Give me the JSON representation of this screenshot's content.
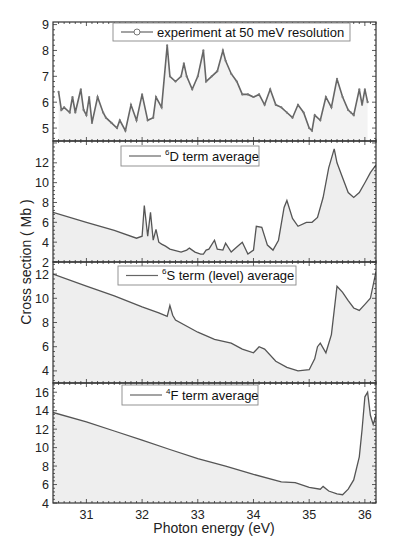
{
  "chart_data": {
    "type": "area",
    "layout": "4 vertically stacked panels sharing x-axis",
    "xlabel": "Photon energy (eV)",
    "ylabel": "Cross section  ( Mb )",
    "xlim": [
      30.4,
      36.2
    ],
    "xticks": [
      31,
      32,
      33,
      34,
      35,
      36
    ],
    "grid": false,
    "panels": [
      {
        "id": "experiment",
        "legend": "experiment at 50 meV resolution",
        "legend_marker": "circle-line",
        "ylim": [
          4.5,
          9.1
        ],
        "yticks": [
          5,
          6,
          7,
          8,
          9
        ],
        "x": [
          30.5,
          30.55,
          30.6,
          30.7,
          30.75,
          30.8,
          30.9,
          30.95,
          31.0,
          31.05,
          31.1,
          31.2,
          31.3,
          31.35,
          31.45,
          31.55,
          31.6,
          31.7,
          31.8,
          31.9,
          32.0,
          32.1,
          32.2,
          32.25,
          32.35,
          32.45,
          32.5,
          32.6,
          32.7,
          32.75,
          32.8,
          32.9,
          33.0,
          33.1,
          33.15,
          33.25,
          33.35,
          33.45,
          33.5,
          33.6,
          33.7,
          33.8,
          33.9,
          34.0,
          34.1,
          34.2,
          34.3,
          34.4,
          34.5,
          34.6,
          34.7,
          34.8,
          34.9,
          35.0,
          35.05,
          35.1,
          35.2,
          35.3,
          35.4,
          35.5,
          35.6,
          35.7,
          35.75,
          35.8,
          35.9,
          35.95,
          36.0,
          36.05
        ],
        "y": [
          6.4,
          5.7,
          5.8,
          5.6,
          6.2,
          5.6,
          6.5,
          5.7,
          5.5,
          6.2,
          5.2,
          6.2,
          5.6,
          5.4,
          5.2,
          5.0,
          5.3,
          4.9,
          5.9,
          5.3,
          6.3,
          5.3,
          5.4,
          6.2,
          5.8,
          8.2,
          7.0,
          6.8,
          7.0,
          7.5,
          7.0,
          6.5,
          7.0,
          8.0,
          6.8,
          7.0,
          7.2,
          8.0,
          7.6,
          7.1,
          6.8,
          6.3,
          6.3,
          6.2,
          6.3,
          5.9,
          6.5,
          5.9,
          5.8,
          5.6,
          5.4,
          5.9,
          5.6,
          5.0,
          4.9,
          5.5,
          5.3,
          6.2,
          5.8,
          6.9,
          6.2,
          5.7,
          5.6,
          5.5,
          6.5,
          5.9,
          6.5,
          6.0
        ]
      },
      {
        "id": "6D",
        "legend_sup": "6",
        "legend": "D term average",
        "ylim": [
          2,
          14.2
        ],
        "yticks": [
          2,
          4,
          6,
          8,
          10,
          12
        ],
        "x": [
          30.4,
          31.0,
          31.5,
          31.9,
          32.0,
          32.04,
          32.1,
          32.15,
          32.2,
          32.25,
          32.3,
          32.35,
          32.42,
          32.5,
          32.7,
          32.8,
          32.85,
          32.95,
          33.05,
          33.1,
          33.15,
          33.2,
          33.3,
          33.35,
          33.45,
          33.5,
          33.6,
          33.7,
          33.8,
          33.9,
          34.0,
          34.05,
          34.15,
          34.25,
          34.35,
          34.45,
          34.55,
          34.6,
          34.7,
          34.8,
          34.95,
          35.05,
          35.15,
          35.25,
          35.35,
          35.45,
          35.5,
          35.6,
          35.7,
          35.8,
          35.9,
          36.0,
          36.1,
          36.2
        ],
        "y": [
          7.0,
          6.0,
          5.2,
          4.4,
          4.6,
          7.7,
          4.6,
          7.0,
          4.2,
          5.3,
          4.0,
          3.8,
          3.6,
          3.3,
          3.0,
          3.2,
          3.4,
          3.0,
          2.8,
          2.8,
          3.2,
          3.3,
          4.2,
          3.3,
          3.2,
          3.9,
          3.0,
          3.5,
          4.0,
          2.8,
          3.2,
          5.6,
          5.5,
          3.7,
          3.2,
          4.2,
          7.5,
          8.2,
          6.4,
          5.6,
          6.0,
          6.0,
          6.5,
          8.5,
          11.5,
          13.4,
          12.0,
          10.5,
          9.0,
          8.5,
          9.0,
          10.0,
          11.0,
          11.8
        ]
      },
      {
        "id": "6S",
        "legend_sup": "6",
        "legend": "S term (level) average",
        "ylim": [
          3,
          13
        ],
        "yticks": [
          4,
          6,
          8,
          10,
          12
        ],
        "x": [
          30.4,
          31.0,
          31.5,
          32.0,
          32.3,
          32.45,
          32.5,
          32.55,
          32.6,
          33.0,
          33.3,
          33.6,
          33.8,
          34.0,
          34.1,
          34.2,
          34.4,
          34.6,
          34.8,
          35.0,
          35.1,
          35.15,
          35.2,
          35.3,
          35.4,
          35.5,
          35.6,
          35.7,
          35.8,
          35.9,
          36.0,
          36.1,
          36.2
        ],
        "y": [
          12.0,
          11.0,
          10.2,
          9.3,
          8.8,
          8.5,
          9.4,
          8.6,
          8.2,
          7.2,
          6.6,
          6.3,
          5.8,
          5.5,
          6.0,
          5.8,
          4.8,
          4.3,
          4.0,
          4.1,
          5.0,
          6.0,
          6.3,
          5.5,
          7.0,
          11.0,
          10.5,
          9.8,
          9.2,
          9.0,
          9.5,
          10.0,
          12.2
        ]
      },
      {
        "id": "4F",
        "legend_sup": "4",
        "legend": "F term average",
        "ylim": [
          4,
          17
        ],
        "yticks": [
          4,
          6,
          8,
          10,
          12,
          14,
          16
        ],
        "x": [
          30.4,
          31.0,
          31.5,
          32.0,
          32.5,
          33.0,
          33.5,
          34.0,
          34.5,
          34.75,
          35.0,
          35.2,
          35.25,
          35.35,
          35.5,
          35.6,
          35.7,
          35.8,
          35.9,
          35.95,
          36.0,
          36.05,
          36.1,
          36.15,
          36.2
        ],
        "y": [
          13.8,
          12.8,
          11.8,
          10.8,
          9.8,
          8.8,
          8.0,
          7.1,
          6.3,
          6.2,
          5.7,
          5.5,
          5.8,
          5.3,
          5.0,
          4.9,
          5.5,
          6.5,
          9.0,
          12.0,
          15.5,
          16.0,
          13.5,
          12.5,
          13.5
        ]
      }
    ]
  },
  "layout_px": {
    "plot_left": 53,
    "plot_right": 376,
    "panel_bounds": [
      [
        22,
        141
      ],
      [
        141,
        262
      ],
      [
        262,
        383
      ],
      [
        383,
        503
      ]
    ],
    "legend_boxes": [
      [
        113,
        23,
        237,
        18
      ],
      [
        121,
        146,
        138,
        20
      ],
      [
        118,
        266,
        178,
        19
      ],
      [
        122,
        385,
        136,
        20
      ]
    ]
  }
}
